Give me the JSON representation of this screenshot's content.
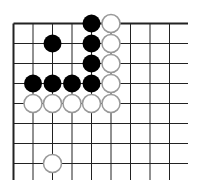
{
  "board": {
    "cols": 9,
    "rows": 8,
    "origin_x": 13.5,
    "origin_y": 23.5,
    "spacing_x": 19.5,
    "spacing_y": 20,
    "line_extend_right": 188,
    "line_extend_bottom": 180,
    "edges": {
      "left": true,
      "top": true,
      "right": false,
      "bottom": false
    },
    "line_color": "#222222",
    "background": "#ffffff"
  },
  "stones": [
    {
      "color": "black",
      "col": 4,
      "row": 0
    },
    {
      "color": "white",
      "col": 5,
      "row": 0
    },
    {
      "color": "black",
      "col": 2,
      "row": 1
    },
    {
      "color": "black",
      "col": 4,
      "row": 1
    },
    {
      "color": "white",
      "col": 5,
      "row": 1
    },
    {
      "color": "black",
      "col": 4,
      "row": 2
    },
    {
      "color": "white",
      "col": 5,
      "row": 2
    },
    {
      "color": "black",
      "col": 1,
      "row": 3
    },
    {
      "color": "black",
      "col": 2,
      "row": 3
    },
    {
      "color": "black",
      "col": 3,
      "row": 3
    },
    {
      "color": "black",
      "col": 4,
      "row": 3
    },
    {
      "color": "white",
      "col": 5,
      "row": 3
    },
    {
      "color": "white",
      "col": 1,
      "row": 4
    },
    {
      "color": "white",
      "col": 2,
      "row": 4
    },
    {
      "color": "white",
      "col": 3,
      "row": 4
    },
    {
      "color": "white",
      "col": 4,
      "row": 4
    },
    {
      "color": "white",
      "col": 5,
      "row": 4
    },
    {
      "color": "white",
      "col": 2,
      "row": 7
    }
  ],
  "stone_style": {
    "radius": 9,
    "black_fill": "#000000",
    "white_fill": "#ffffff",
    "white_stroke": "#999999"
  }
}
